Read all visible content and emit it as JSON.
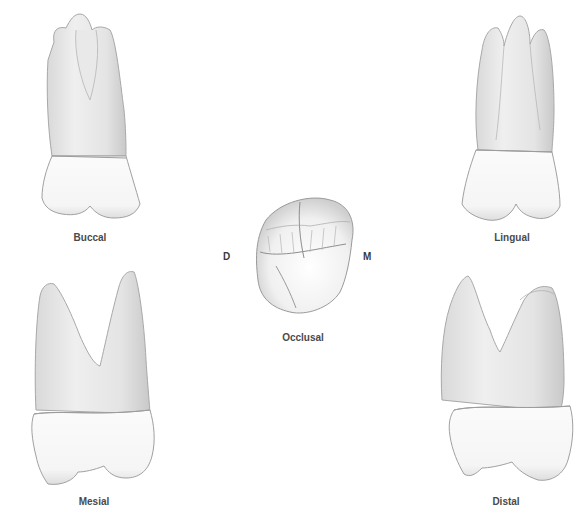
{
  "figure": {
    "views": [
      {
        "id": "buccal",
        "label": "Buccal"
      },
      {
        "id": "lingual",
        "label": "Lingual"
      },
      {
        "id": "occlusal",
        "label": "Occlusal"
      },
      {
        "id": "mesial",
        "label": "Mesial"
      },
      {
        "id": "distal",
        "label": "Distal"
      }
    ],
    "orientation": {
      "left": "D",
      "right": "M"
    },
    "colors": {
      "enamel": "#f7f7f7",
      "root": "#e6e6e6",
      "outline": "#9a9a9a",
      "shadow": "#c8c8c8",
      "label": "#4a4a4a"
    }
  }
}
